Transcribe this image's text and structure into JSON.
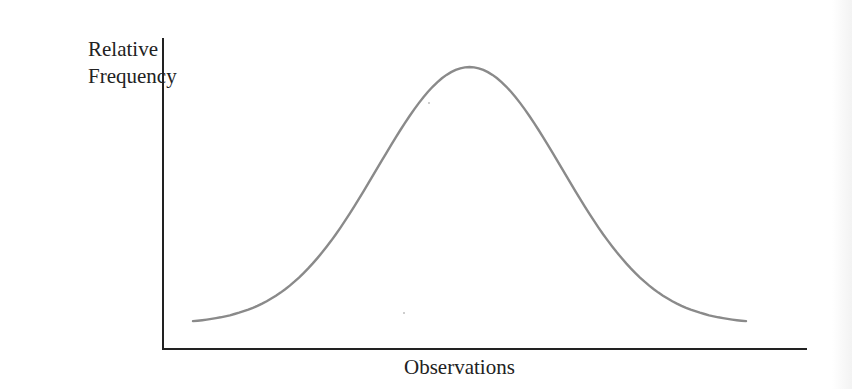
{
  "chart_data": {
    "type": "line",
    "title": "",
    "xlabel": "Observations",
    "ylabel": "Relative Frequency",
    "ylabel_lines": [
      "Relative",
      "Frequency"
    ],
    "series": [
      {
        "name": "normal distribution",
        "x": [
          -3,
          -2.5,
          -2,
          -1.5,
          -1,
          -0.5,
          0,
          0.5,
          1,
          1.5,
          2,
          2.5,
          3
        ],
        "values": [
          0.004,
          0.018,
          0.054,
          0.13,
          0.242,
          0.352,
          0.399,
          0.352,
          0.242,
          0.13,
          0.054,
          0.018,
          0.004
        ]
      }
    ],
    "grid": false,
    "ticks": false,
    "legend": null
  },
  "colors": {
    "axis": "#222222",
    "curve": "#8a8a8a",
    "text": "#222222"
  },
  "labels": {
    "y_line1": "Relative",
    "y_line2": "Frequency",
    "x": "Observations"
  }
}
